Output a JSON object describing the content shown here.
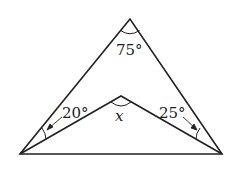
{
  "diagram": {
    "type": "geometry",
    "colors": {
      "stroke": "#222222",
      "background": "#ffffff"
    },
    "points": {
      "apex": [
        130,
        19
      ],
      "bottom_left": [
        20,
        154
      ],
      "bottom_right": [
        222,
        154
      ],
      "inner": [
        121,
        96
      ]
    },
    "labels": {
      "apex_angle": "75°",
      "left_angle": "20°",
      "right_angle": "25°",
      "inner_angle": "x"
    }
  }
}
